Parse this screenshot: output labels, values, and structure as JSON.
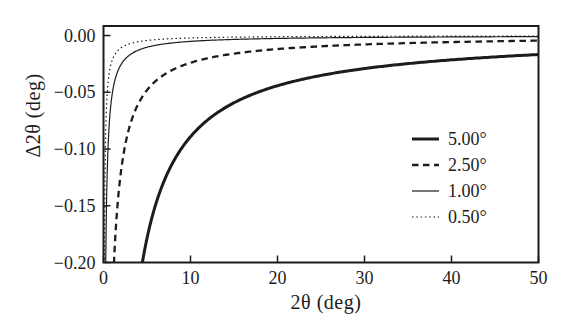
{
  "page": {
    "background": "#ffffff",
    "ink": "#1c1c1c"
  },
  "chart_data": {
    "type": "line",
    "title": "",
    "xlabel": "2θ (deg)",
    "ylabel": "Δ2θ (deg)",
    "xlim": [
      0,
      50
    ],
    "ylim": [
      -0.2,
      0.0084
    ],
    "x_ticks": [
      0,
      10,
      20,
      30,
      40,
      50
    ],
    "x_tick_labels": [
      "0",
      "10",
      "20",
      "30",
      "40",
      "50"
    ],
    "y_ticks": [
      0,
      -0.05,
      -0.1,
      -0.15,
      -0.2
    ],
    "y_tick_labels": [
      "0.00",
      "−0.05",
      "−0.10",
      "−0.15",
      "−0.20"
    ],
    "grid": false,
    "legend_position": "inside-right",
    "model": "Δ2θ = −C / tan(2θ/2), angles in degrees",
    "series": [
      {
        "name": "5.00°",
        "line": "solid",
        "width": 3.0,
        "dash": null,
        "C": 0.0078,
        "points": {
          "x": [
            4.5,
            5,
            6,
            7,
            8,
            10,
            12,
            15,
            18,
            21,
            25,
            30,
            35,
            40,
            45,
            50
          ],
          "y": [
            -0.1985,
            -0.1786,
            -0.1488,
            -0.1275,
            -0.1115,
            -0.0892,
            -0.0742,
            -0.0592,
            -0.0492,
            -0.0421,
            -0.0352,
            -0.0291,
            -0.0247,
            -0.0214,
            -0.0188,
            -0.0167
          ]
        }
      },
      {
        "name": "2.50°",
        "line": "dashed",
        "width": 2.3,
        "dash": [
          6.5,
          4.5
        ],
        "C": 0.0021,
        "points": {
          "x": [
            1.2,
            1.5,
            2,
            3,
            4,
            5,
            6,
            8,
            10,
            12,
            15,
            20,
            25,
            30,
            35,
            40,
            45,
            50
          ],
          "y": [
            -0.2005,
            -0.1604,
            -0.1203,
            -0.0802,
            -0.0601,
            -0.0481,
            -0.0401,
            -0.03,
            -0.024,
            -0.02,
            -0.016,
            -0.0119,
            -0.0095,
            -0.0078,
            -0.0067,
            -0.0058,
            -0.0051,
            -0.0045
          ]
        }
      },
      {
        "name": "1.00°",
        "line": "solid",
        "width": 1.2,
        "dash": null,
        "C": 0.00045,
        "points": {
          "x": [
            0.26,
            0.3,
            0.5,
            0.7,
            1,
            1.5,
            2,
            3,
            4,
            5,
            7,
            10,
            15,
            20,
            30,
            40,
            50
          ],
          "y": [
            -0.1983,
            -0.1719,
            -0.1031,
            -0.0737,
            -0.0516,
            -0.0344,
            -0.0258,
            -0.0172,
            -0.0129,
            -0.0103,
            -0.0074,
            -0.0051,
            -0.0034,
            -0.0026,
            -0.0017,
            -0.0012,
            -0.001
          ]
        }
      },
      {
        "name": "0.50°",
        "line": "dotted",
        "width": 1.2,
        "dash": [
          1.5,
          2.8
        ],
        "C": 0.00019,
        "points": {
          "x": [
            0.11,
            0.2,
            0.3,
            0.5,
            0.7,
            1,
            1.5,
            2,
            3,
            5,
            7,
            10,
            15,
            20,
            30,
            40,
            50
          ],
          "y": [
            -0.1979,
            -0.1089,
            -0.0726,
            -0.0435,
            -0.0311,
            -0.0218,
            -0.0145,
            -0.0109,
            -0.0073,
            -0.0044,
            -0.0031,
            -0.0022,
            -0.0015,
            -0.0011,
            -0.0007,
            -0.0005,
            -0.0004
          ]
        }
      }
    ]
  }
}
